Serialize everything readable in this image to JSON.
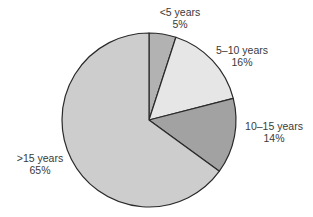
{
  "chart_data": {
    "type": "pie",
    "title": "",
    "categories": [
      "<5 years",
      "5–10 years",
      "10–15 years",
      ">15 years"
    ],
    "values": [
      5,
      16,
      14,
      65
    ],
    "value_labels": [
      "5%",
      "16%",
      "14%",
      "65%"
    ],
    "colors": [
      "#b2b2b2",
      "#e6e6e6",
      "#a2a2a2",
      "#cdcdcd"
    ],
    "start_angle_deg": 0,
    "direction": "clockwise-from-top",
    "legend": "none (labels placed beside slices)",
    "grid": false
  },
  "labels": [
    {
      "name": "<5 years",
      "pct": "5%"
    },
    {
      "name": "5–10 years",
      "pct": "16%"
    },
    {
      "name": "10–15 years",
      "pct": "14%"
    },
    {
      "name": ">15 years",
      "pct": "65%"
    }
  ]
}
